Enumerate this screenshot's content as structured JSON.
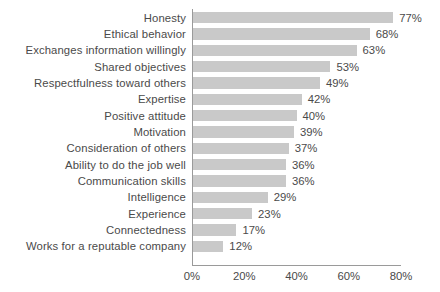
{
  "chart_data": {
    "type": "bar",
    "orientation": "horizontal",
    "title": "",
    "subtitle": "",
    "xlabel": "",
    "ylabel": "",
    "xlim": [
      0,
      80
    ],
    "grid": false,
    "legend": null,
    "value_suffix": "%",
    "bar_color": "#c9c9c9",
    "text_color": "#4a4a4a",
    "axis_color": "#9a9a9a",
    "background_color": "#ffffff",
    "x_ticks": [
      {
        "value": 0,
        "label": "0%"
      },
      {
        "value": 20,
        "label": "20%"
      },
      {
        "value": 40,
        "label": "40%"
      },
      {
        "value": 60,
        "label": "60%"
      },
      {
        "value": 80,
        "label": "80%"
      }
    ],
    "categories": [
      "Honesty",
      "Ethical behavior",
      "Exchanges information willingly",
      "Shared objectives",
      "Respectfulness toward others",
      "Expertise",
      "Positive attitude",
      "Motivation",
      "Consideration of others",
      "Ability to do the job well",
      "Communication skills",
      "Intelligence",
      "Experience",
      "Connectedness",
      "Works for a reputable company"
    ],
    "values": [
      77,
      68,
      63,
      53,
      49,
      42,
      40,
      39,
      37,
      36,
      36,
      29,
      23,
      17,
      12
    ],
    "data_labels": [
      "77%",
      "68%",
      "63%",
      "53%",
      "49%",
      "42%",
      "40%",
      "39%",
      "37%",
      "36%",
      "36%",
      "29%",
      "23%",
      "17%",
      "12%"
    ]
  }
}
